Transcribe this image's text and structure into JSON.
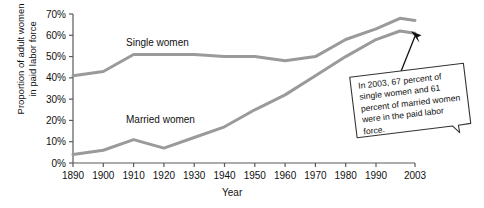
{
  "chart_data": {
    "type": "line",
    "title": "",
    "xlabel": "Year",
    "ylabel_line1": "Proportion of adult women",
    "ylabel_line2": "in paid labor force",
    "xlim": [
      1890,
      2003
    ],
    "ylim": [
      0,
      70
    ],
    "grid": false,
    "legend_position": "inline-labels",
    "ytick_labels": [
      "0%",
      "10%",
      "20%",
      "30%",
      "40%",
      "50%",
      "60%",
      "70%"
    ],
    "ytick_values": [
      0,
      10,
      20,
      30,
      40,
      50,
      60,
      70
    ],
    "xtick_labels": [
      "1890",
      "1900",
      "1910",
      "1920",
      "1930",
      "1940",
      "1950",
      "1960",
      "1970",
      "1980",
      "1990",
      "2003"
    ],
    "xtick_values": [
      1890,
      1900,
      1910,
      1920,
      1930,
      1940,
      1950,
      1960,
      1970,
      1980,
      1990,
      2003
    ],
    "series": [
      {
        "name": "Single women",
        "color": "#9a9a9a",
        "x": [
          1890,
          1900,
          1910,
          1920,
          1930,
          1940,
          1950,
          1960,
          1970,
          1980,
          1990,
          1998,
          2003
        ],
        "values": [
          41,
          43,
          51,
          51,
          51,
          50,
          50,
          48,
          50,
          58,
          63,
          68,
          67
        ]
      },
      {
        "name": "Married women",
        "color": "#9a9a9a",
        "x": [
          1890,
          1900,
          1910,
          1920,
          1930,
          1940,
          1950,
          1960,
          1970,
          1980,
          1990,
          1998,
          2003
        ],
        "values": [
          4,
          6,
          11,
          7,
          12,
          17,
          25,
          32,
          41,
          50,
          58,
          62,
          61
        ]
      }
    ],
    "annotations": [
      {
        "name": "callout",
        "text": "In 2003, 67 percent of single women and 61 percent of married women were in the paid labor force."
      }
    ]
  },
  "labels": {
    "single_women": "Single women",
    "married_women": "Married women"
  },
  "callout": {
    "text": "In 2003, 67 percent of single women and 61 percent of married women were in the paid labor force."
  },
  "colors": {
    "line": "#9a9a9a",
    "axis": "#5a5a5a",
    "text": "#111111",
    "callout_border": "#3a3a3a",
    "callout_fill": "#ffffff"
  }
}
